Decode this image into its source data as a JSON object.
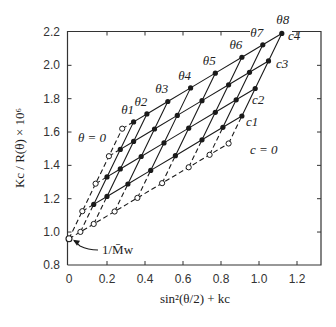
{
  "chart_data": {
    "type": "scatter",
    "subtype": "zimm-plot",
    "title": "",
    "xlabel": "sin²(θ/2) + kc",
    "ylabel": "Kc / R(θ) × 10⁶",
    "xlim": [
      0,
      1.3
    ],
    "ylim": [
      0.8,
      2.2
    ],
    "x_ticks": [
      0,
      0.2,
      0.4,
      0.6,
      0.8,
      1.0,
      1.2
    ],
    "x_tick_labels": [
      "0",
      "0.2",
      "0.4",
      "0.6",
      "0.8",
      "1.0",
      "1.2"
    ],
    "y_ticks": [
      0.8,
      1.0,
      1.2,
      1.4,
      1.6,
      1.8,
      2.0,
      2.2
    ],
    "y_tick_labels": [
      "0.8",
      "1.0",
      "1.2",
      "1.4",
      "1.6",
      "1.8",
      "2.0",
      "2.2"
    ],
    "grid": false,
    "intercept": {
      "x": 0,
      "y": 0.96,
      "label": "1/M̄w"
    },
    "theta_labels": [
      "θ = 0",
      "θ1",
      "θ2",
      "θ3",
      "θ4",
      "θ5",
      "θ6",
      "θ7",
      "θ8"
    ],
    "conc_labels": [
      "c = 0",
      "c1",
      "c2",
      "c3",
      "c4"
    ],
    "theta_offsets": [
      0,
      0.06,
      0.13,
      0.24,
      0.36,
      0.49,
      0.63,
      0.74,
      0.84
    ],
    "theta_slope": 0.68,
    "conc_step": {
      "dx": 0.07,
      "dy": 0.165
    },
    "series_measured": [
      {
        "name": "c1",
        "points": [
          [
            0.13,
            1.17
          ],
          [
            0.2,
            1.21
          ],
          [
            0.31,
            1.29
          ],
          [
            0.43,
            1.37
          ],
          [
            0.56,
            1.46
          ],
          [
            0.7,
            1.55
          ],
          [
            0.81,
            1.63
          ],
          [
            0.91,
            1.7
          ]
        ]
      },
      {
        "name": "c2",
        "points": [
          [
            0.2,
            1.33
          ],
          [
            0.27,
            1.38
          ],
          [
            0.38,
            1.45
          ],
          [
            0.5,
            1.54
          ],
          [
            0.63,
            1.62
          ],
          [
            0.77,
            1.72
          ],
          [
            0.88,
            1.79
          ],
          [
            0.98,
            1.86
          ]
        ]
      },
      {
        "name": "c3",
        "points": [
          [
            0.27,
            1.5
          ],
          [
            0.34,
            1.54
          ],
          [
            0.45,
            1.62
          ],
          [
            0.57,
            1.7
          ],
          [
            0.7,
            1.79
          ],
          [
            0.84,
            1.88
          ],
          [
            0.95,
            1.96
          ],
          [
            1.05,
            2.03
          ]
        ]
      },
      {
        "name": "c4",
        "points": [
          [
            0.34,
            1.66
          ],
          [
            0.41,
            1.71
          ],
          [
            0.52,
            1.78
          ],
          [
            0.64,
            1.87
          ],
          [
            0.77,
            1.95
          ],
          [
            0.91,
            2.05
          ],
          [
            1.02,
            2.12
          ],
          [
            1.12,
            2.19
          ]
        ]
      }
    ],
    "series_extrapolated": [
      {
        "name": "c = 0",
        "points": [
          [
            0,
            0.96
          ],
          [
            0.06,
            1.0
          ],
          [
            0.13,
            1.05
          ],
          [
            0.24,
            1.12
          ],
          [
            0.36,
            1.2
          ],
          [
            0.49,
            1.29
          ],
          [
            0.63,
            1.39
          ],
          [
            0.74,
            1.46
          ],
          [
            0.84,
            1.53
          ]
        ]
      },
      {
        "name": "θ = 0",
        "points": [
          [
            0,
            0.96
          ],
          [
            0.07,
            1.125
          ],
          [
            0.14,
            1.29
          ],
          [
            0.21,
            1.455
          ],
          [
            0.28,
            1.62
          ]
        ]
      }
    ]
  },
  "colors": {
    "axis": "#333333",
    "line": "#1a1a1a",
    "marker_fill": "#1a1a1a",
    "open_fill": "#ffffff"
  }
}
